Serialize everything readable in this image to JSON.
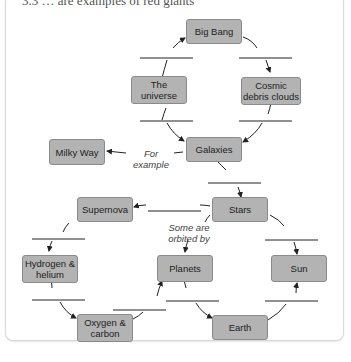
{
  "caption": "3.3 … are examples of red giants",
  "nodes": {
    "big_bang": "Big Bang",
    "universe": "The universe",
    "cosmic": "Cosmic debris clouds",
    "galaxies": "Galaxies",
    "milky_way": "Milky Way",
    "stars": "Stars",
    "supernova": "Supernova",
    "hydrogen": "Hydrogen & helium",
    "planets": "Planets",
    "sun": "Sun",
    "oxygen": "Oxygen & carbon",
    "earth": "Earth"
  },
  "labels": {
    "for_example": "For example",
    "some_are": "Some are orbited by"
  },
  "colors": {
    "node_fill": "#b3b3b3",
    "node_border": "#8a8a8a",
    "line": "#222222"
  }
}
